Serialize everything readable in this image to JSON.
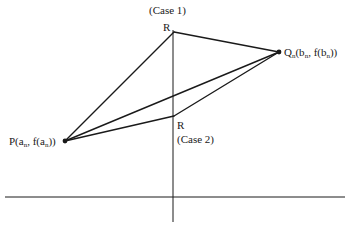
{
  "diagram": {
    "type": "geometric construction",
    "colors": {
      "stroke": "#1a1a1a",
      "background": "#ffffff"
    },
    "axes": {
      "x_axis": {
        "y": 197,
        "x1": 5,
        "x2": 345
      },
      "y_axis": {
        "x": 173,
        "y1": 30,
        "y2": 222
      }
    },
    "points": {
      "P": {
        "x": 65,
        "y": 141,
        "label": "P(a",
        "sub": "n",
        "label_mid": ", f(a",
        "sub2": "n",
        "label_end": "))"
      },
      "Q": {
        "x": 279,
        "y": 52,
        "label": "Q",
        "sub": "n",
        "label_mid": "(b",
        "sub2": "n",
        "label_mid2": ", f(b",
        "sub3": "n",
        "label_end": "))"
      },
      "R1": {
        "x": 174,
        "y": 32,
        "label": "R",
        "case_label": "(Case 1)"
      },
      "R2": {
        "x": 174,
        "y": 116,
        "label": "R",
        "case_label": "(Case 2)"
      }
    },
    "segments": [
      {
        "from": "P",
        "to": "R1"
      },
      {
        "from": "R1",
        "to": "Q"
      },
      {
        "from": "P",
        "to": "Q"
      },
      {
        "from": "P",
        "to": "R2"
      },
      {
        "from": "R2",
        "to": "Q"
      }
    ]
  }
}
